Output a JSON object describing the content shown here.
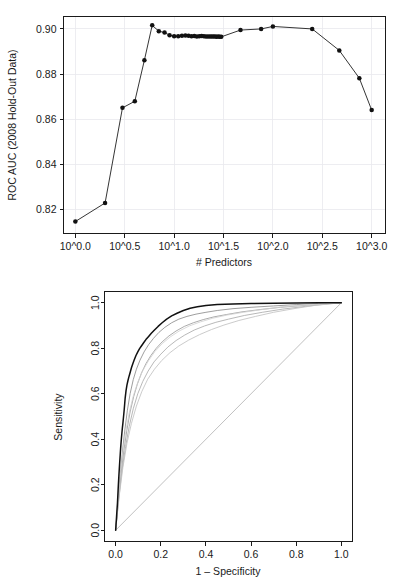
{
  "page": {
    "background": "#ffffff",
    "width": 398,
    "height": 582
  },
  "figures": [
    {
      "name": "auc-vs-predictors",
      "xlabel": "# Predictors",
      "ylabel": "ROC AUC (2008 Hold-Out Data)"
    },
    {
      "name": "roc-curves",
      "xlabel": "1 – Specificity",
      "ylabel": "Sensitivity"
    }
  ],
  "chart_data": [
    {
      "type": "line",
      "name": "auc-vs-predictors",
      "title": "",
      "xlabel": "# Predictors",
      "ylabel": "ROC AUC (2008 Hold-Out Data)",
      "x_scale": "log10",
      "xlim": [
        -0.12,
        3.14
      ],
      "ylim": [
        0.8095,
        0.9055
      ],
      "xticks": [
        0.0,
        0.5,
        1.0,
        1.5,
        2.0,
        2.5,
        3.0
      ],
      "xticklabels": [
        "10^0.0",
        "10^0.5",
        "10^1.0",
        "10^1.5",
        "10^2.0",
        "10^2.5",
        "10^3.0"
      ],
      "yticks": [
        0.82,
        0.84,
        0.86,
        0.88,
        0.9
      ],
      "yticklabels": [
        "0.82",
        "0.84",
        "0.86",
        "0.88",
        "0.90"
      ],
      "grid": true,
      "legend": "none",
      "markers": "filled-circle",
      "x_log10": [
        0.0,
        0.301,
        0.477,
        0.602,
        0.699,
        0.778,
        0.845,
        0.903,
        0.954,
        1.0,
        1.041,
        1.079,
        1.114,
        1.146,
        1.176,
        1.204,
        1.23,
        1.255,
        1.279,
        1.301,
        1.322,
        1.342,
        1.362,
        1.38,
        1.398,
        1.415,
        1.431,
        1.447,
        1.462,
        1.477,
        1.672,
        1.881,
        2.0,
        2.398,
        2.672,
        2.875,
        3.0
      ],
      "values": [
        0.8148,
        0.823,
        0.8651,
        0.868,
        0.8862,
        0.9016,
        0.899,
        0.8984,
        0.8972,
        0.8968,
        0.8968,
        0.897,
        0.8971,
        0.897,
        0.8968,
        0.8969,
        0.8967,
        0.8968,
        0.8969,
        0.8968,
        0.8967,
        0.8967,
        0.8966,
        0.8967,
        0.8966,
        0.8966,
        0.8965,
        0.8966,
        0.8965,
        0.8965,
        0.8995,
        0.9,
        0.9011,
        0.9,
        0.8905,
        0.8782,
        0.8641
      ]
    },
    {
      "type": "line",
      "name": "roc-curves",
      "title": "",
      "xlabel": "1 – Specificity",
      "ylabel": "Sensitivity",
      "xlim": [
        0.0,
        1.0
      ],
      "ylim": [
        0.0,
        1.0
      ],
      "xticks": [
        0.0,
        0.2,
        0.4,
        0.6,
        0.8,
        1.0
      ],
      "xticklabels": [
        "0.0",
        "0.2",
        "0.4",
        "0.6",
        "0.8",
        "1.0"
      ],
      "yticks": [
        0.0,
        0.2,
        0.4,
        0.6,
        0.8,
        1.0
      ],
      "yticklabels": [
        "0.0",
        "0.2",
        "0.4",
        "0.6",
        "0.8",
        "1.0"
      ],
      "grid": false,
      "legend": "none",
      "reference_line": {
        "name": "chance-diagonal",
        "from": [
          0.0,
          0.0
        ],
        "to": [
          1.0,
          1.0
        ],
        "color": "#b9b9b9"
      },
      "series": [
        {
          "name": "primary-model",
          "color": "#111111",
          "width": 1.5,
          "x": [
            0.0,
            0.004,
            0.008,
            0.01,
            0.012,
            0.014,
            0.016,
            0.018,
            0.02,
            0.022,
            0.024,
            0.026,
            0.028,
            0.03,
            0.032,
            0.034,
            0.036,
            0.038,
            0.04,
            0.042,
            0.046,
            0.05,
            0.054,
            0.058,
            0.062,
            0.066,
            0.07,
            0.076,
            0.082,
            0.09,
            0.098,
            0.106,
            0.114,
            0.124,
            0.134,
            0.146,
            0.158,
            0.172,
            0.188,
            0.206,
            0.226,
            0.248,
            0.272,
            0.3,
            0.33,
            0.362,
            0.4,
            0.45,
            0.52,
            0.6,
            0.7,
            0.8,
            0.9,
            1.0
          ],
          "y": [
            0.0,
            0.06,
            0.12,
            0.16,
            0.2,
            0.235,
            0.268,
            0.3,
            0.33,
            0.36,
            0.386,
            0.41,
            0.432,
            0.452,
            0.47,
            0.49,
            0.51,
            0.532,
            0.556,
            0.58,
            0.614,
            0.638,
            0.656,
            0.672,
            0.686,
            0.7,
            0.714,
            0.732,
            0.748,
            0.768,
            0.784,
            0.798,
            0.81,
            0.824,
            0.838,
            0.852,
            0.866,
            0.88,
            0.896,
            0.912,
            0.928,
            0.942,
            0.954,
            0.966,
            0.976,
            0.982,
            0.988,
            0.992,
            0.995,
            0.997,
            0.998,
            0.999,
            1.0,
            1.0
          ]
        },
        {
          "name": "resample-curve-1",
          "color": "#8d8d8d",
          "width": 0.85,
          "x": [
            0.0,
            0.01,
            0.02,
            0.03,
            0.04,
            0.052,
            0.064,
            0.078,
            0.092,
            0.108,
            0.126,
            0.146,
            0.168,
            0.192,
            0.218,
            0.248,
            0.28,
            0.316,
            0.356,
            0.4,
            0.45,
            0.52,
            0.6,
            0.7,
            0.8,
            0.9,
            1.0
          ],
          "y": [
            0.0,
            0.118,
            0.236,
            0.344,
            0.436,
            0.528,
            0.6,
            0.662,
            0.708,
            0.748,
            0.784,
            0.816,
            0.844,
            0.87,
            0.892,
            0.912,
            0.928,
            0.94,
            0.95,
            0.958,
            0.966,
            0.974,
            0.98,
            0.986,
            0.992,
            0.997,
            1.0
          ]
        },
        {
          "name": "resample-curve-2",
          "color": "#9c9c9c",
          "width": 0.85,
          "x": [
            0.0,
            0.012,
            0.024,
            0.036,
            0.05,
            0.064,
            0.08,
            0.096,
            0.114,
            0.134,
            0.156,
            0.18,
            0.206,
            0.236,
            0.268,
            0.304,
            0.344,
            0.388,
            0.436,
            0.49,
            0.56,
            0.64,
            0.73,
            0.83,
            0.92,
            1.0
          ],
          "y": [
            0.0,
            0.13,
            0.25,
            0.35,
            0.442,
            0.52,
            0.588,
            0.642,
            0.69,
            0.732,
            0.768,
            0.8,
            0.828,
            0.854,
            0.876,
            0.896,
            0.912,
            0.926,
            0.938,
            0.948,
            0.96,
            0.97,
            0.98,
            0.988,
            0.995,
            1.0
          ]
        },
        {
          "name": "resample-curve-3",
          "color": "#ababab",
          "width": 0.85,
          "x": [
            0.0,
            0.014,
            0.028,
            0.044,
            0.06,
            0.078,
            0.098,
            0.12,
            0.144,
            0.17,
            0.2,
            0.232,
            0.268,
            0.306,
            0.348,
            0.394,
            0.444,
            0.5,
            0.57,
            0.65,
            0.74,
            0.84,
            0.93,
            1.0
          ],
          "y": [
            0.0,
            0.14,
            0.262,
            0.368,
            0.456,
            0.534,
            0.6,
            0.654,
            0.7,
            0.74,
            0.774,
            0.806,
            0.834,
            0.858,
            0.88,
            0.898,
            0.914,
            0.928,
            0.944,
            0.958,
            0.972,
            0.984,
            0.994,
            1.0
          ]
        },
        {
          "name": "resample-curve-4",
          "color": "#c2c2c2",
          "width": 0.85,
          "x": [
            0.0,
            0.016,
            0.032,
            0.05,
            0.07,
            0.092,
            0.116,
            0.142,
            0.172,
            0.204,
            0.24,
            0.28,
            0.324,
            0.372,
            0.424,
            0.48,
            0.546,
            0.62,
            0.7,
            0.79,
            0.88,
            1.0
          ],
          "y": [
            0.0,
            0.152,
            0.276,
            0.382,
            0.47,
            0.546,
            0.61,
            0.664,
            0.708,
            0.746,
            0.78,
            0.81,
            0.836,
            0.86,
            0.882,
            0.902,
            0.922,
            0.94,
            0.958,
            0.974,
            0.988,
            1.0
          ]
        },
        {
          "name": "resample-curve-5",
          "color": "#d2d2d2",
          "width": 0.85,
          "x": [
            0.0,
            0.008,
            0.018,
            0.03,
            0.044,
            0.06,
            0.078,
            0.098,
            0.12,
            0.146,
            0.174,
            0.206,
            0.242,
            0.282,
            0.326,
            0.376,
            0.43,
            0.494,
            0.566,
            0.648,
            0.74,
            0.84,
            0.93,
            1.0
          ],
          "y": [
            0.0,
            0.1,
            0.215,
            0.33,
            0.43,
            0.516,
            0.59,
            0.65,
            0.702,
            0.746,
            0.786,
            0.82,
            0.85,
            0.876,
            0.898,
            0.916,
            0.932,
            0.946,
            0.958,
            0.97,
            0.982,
            0.99,
            0.996,
            1.0
          ]
        }
      ]
    }
  ]
}
